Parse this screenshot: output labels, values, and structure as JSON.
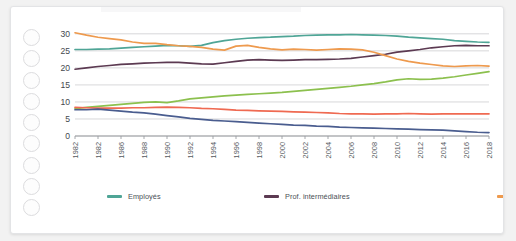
{
  "card": {
    "punch_hole_count": 9
  },
  "legend": {
    "position": "bottom",
    "items": [
      {
        "label": "Employés",
        "color": "#4fa596"
      },
      {
        "label": "Prof. intermédiaires",
        "color": "#5c3a52"
      },
      {
        "label": "Ouvriers",
        "color": "#ee9a4e"
      },
      {
        "label": "Cadres supérieurs",
        "color": "#8cc04e"
      },
      {
        "label": "Artisans, commerçants, chef d'entreprise",
        "color": "#ef6a52"
      },
      {
        "label": "Agriculteur exploitant",
        "color": "#4a5d8f"
      }
    ]
  },
  "chart_data": {
    "type": "line",
    "title": "",
    "subtitle": "",
    "xlabel": "",
    "ylabel": "",
    "grid": true,
    "legend_position": "bottom",
    "ylim": [
      0,
      32
    ],
    "yticks": [
      0,
      5,
      10,
      15,
      20,
      25,
      30
    ],
    "ytick_labels": [
      "0",
      "5",
      "10",
      "15",
      "20",
      "25",
      "30"
    ],
    "xlim": [
      1982,
      2018
    ],
    "xtick_labels": [
      "1982",
      "1982",
      "1986",
      "1988",
      "1990",
      "1992",
      "1994",
      "1996",
      "1998",
      "2000",
      "2002",
      "2004",
      "2006",
      "2008",
      "2010",
      "2012",
      "2014",
      "2016",
      "2018"
    ],
    "x": [
      1982,
      1983,
      1984,
      1985,
      1986,
      1987,
      1988,
      1989,
      1990,
      1991,
      1992,
      1993,
      1994,
      1995,
      1996,
      1997,
      1998,
      1999,
      2000,
      2001,
      2002,
      2003,
      2004,
      2005,
      2006,
      2007,
      2008,
      2009,
      2010,
      2011,
      2012,
      2013,
      2014,
      2015,
      2016,
      2017,
      2018
    ],
    "series": [
      {
        "name": "Employés",
        "color": "#4fa596",
        "values": [
          25.4,
          25.4,
          25.5,
          25.6,
          25.8,
          26.0,
          26.2,
          26.4,
          26.6,
          26.5,
          26.3,
          26.6,
          27.4,
          28.0,
          28.4,
          28.7,
          28.9,
          29.0,
          29.2,
          29.3,
          29.5,
          29.6,
          29.7,
          29.7,
          29.8,
          29.7,
          29.6,
          29.5,
          29.3,
          29.0,
          28.8,
          28.6,
          28.4,
          28.0,
          27.8,
          27.6,
          27.5
        ]
      },
      {
        "name": "Prof. intermédiaires",
        "color": "#5c3a52",
        "values": [
          19.6,
          20.0,
          20.4,
          20.7,
          21.0,
          21.2,
          21.4,
          21.5,
          21.6,
          21.6,
          21.4,
          21.2,
          21.1,
          21.5,
          21.9,
          22.3,
          22.4,
          22.3,
          22.2,
          22.3,
          22.4,
          22.4,
          22.5,
          22.6,
          22.8,
          23.2,
          23.6,
          24.0,
          24.6,
          25.0,
          25.4,
          25.9,
          26.2,
          26.5,
          26.6,
          26.5,
          26.5
        ]
      },
      {
        "name": "Ouvriers",
        "color": "#ee9a4e",
        "values": [
          30.3,
          29.6,
          29.0,
          28.6,
          28.2,
          27.6,
          27.2,
          27.2,
          26.8,
          26.5,
          26.3,
          26.0,
          25.5,
          25.2,
          26.4,
          26.6,
          26.0,
          25.6,
          25.3,
          25.5,
          25.4,
          25.2,
          25.4,
          25.6,
          25.5,
          25.3,
          24.6,
          23.6,
          22.6,
          21.9,
          21.4,
          21.0,
          20.6,
          20.4,
          20.6,
          20.7,
          20.5
        ]
      },
      {
        "name": "Cadres supérieurs",
        "color": "#8cc04e",
        "values": [
          8.0,
          8.4,
          8.7,
          9.0,
          9.3,
          9.6,
          9.9,
          10.0,
          9.8,
          10.3,
          10.9,
          11.2,
          11.5,
          11.8,
          12.0,
          12.2,
          12.4,
          12.6,
          12.8,
          13.1,
          13.4,
          13.7,
          14.0,
          14.3,
          14.6,
          15.0,
          15.4,
          15.9,
          16.5,
          16.8,
          16.6,
          16.7,
          17.0,
          17.4,
          17.9,
          18.4,
          18.9
        ]
      },
      {
        "name": "Artisans, commerçants, chef d'entreprise",
        "color": "#ef6a52",
        "values": [
          8.4,
          8.3,
          8.2,
          8.2,
          8.2,
          8.3,
          8.3,
          8.4,
          8.5,
          8.4,
          8.3,
          8.1,
          8.0,
          7.8,
          7.6,
          7.5,
          7.4,
          7.3,
          7.2,
          7.1,
          7.0,
          6.9,
          6.8,
          6.6,
          6.5,
          6.5,
          6.4,
          6.5,
          6.5,
          6.6,
          6.5,
          6.4,
          6.5,
          6.5,
          6.5,
          6.5,
          6.5
        ]
      },
      {
        "name": "Agriculteur exploitant",
        "color": "#4a5d8f",
        "values": [
          7.7,
          7.7,
          7.9,
          7.6,
          7.3,
          7.0,
          6.8,
          6.4,
          6.0,
          5.6,
          5.2,
          4.9,
          4.6,
          4.4,
          4.2,
          4.0,
          3.8,
          3.6,
          3.4,
          3.2,
          3.1,
          2.9,
          2.8,
          2.6,
          2.5,
          2.4,
          2.3,
          2.2,
          2.1,
          2.0,
          1.9,
          1.8,
          1.7,
          1.5,
          1.3,
          1.1,
          1.0
        ]
      }
    ]
  }
}
